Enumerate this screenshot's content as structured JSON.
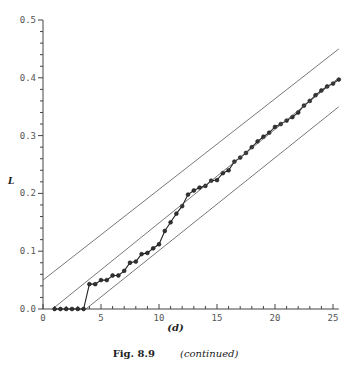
{
  "chart_data": {
    "type": "line",
    "panel_label": "(d)",
    "title": "",
    "xlabel": "",
    "ylabel": "L",
    "xlim": [
      0,
      25.5
    ],
    "ylim": [
      0,
      0.5
    ],
    "x_ticks": [
      0,
      5,
      10,
      15,
      20,
      25
    ],
    "y_ticks": [
      "0.0",
      "0.1",
      "0.2",
      "0.3",
      "0.4",
      "0.5"
    ],
    "grid": false,
    "series": [
      {
        "name": "observed",
        "style": "line with circle markers",
        "x": [
          1,
          1.5,
          2,
          2.5,
          3,
          3.5,
          4,
          4.5,
          5,
          5.5,
          6,
          6.5,
          7,
          7.5,
          8,
          8.5,
          9,
          9.5,
          10,
          10.5,
          11,
          11.5,
          12,
          12.5,
          13,
          13.5,
          14,
          14.5,
          15,
          15.5,
          16,
          16.5,
          17,
          17.5,
          18,
          18.5,
          19,
          19.5,
          20,
          20.5,
          21,
          21.5,
          22,
          22.5,
          23,
          23.5,
          24,
          24.5,
          25,
          25.5
        ],
        "values": [
          0,
          0,
          0,
          0,
          0,
          0,
          0.043,
          0.043,
          0.05,
          0.05,
          0.058,
          0.058,
          0.066,
          0.08,
          0.082,
          0.095,
          0.097,
          0.105,
          0.112,
          0.135,
          0.15,
          0.165,
          0.178,
          0.198,
          0.205,
          0.21,
          0.213,
          0.222,
          0.223,
          0.235,
          0.24,
          0.255,
          0.262,
          0.27,
          0.28,
          0.29,
          0.298,
          0.305,
          0.315,
          0.32,
          0.326,
          0.332,
          0.34,
          0.352,
          0.36,
          0.37,
          0.378,
          0.385,
          0.39,
          0.397
        ]
      },
      {
        "name": "upper band",
        "style": "thin line",
        "x": [
          0,
          25.5
        ],
        "values": [
          0.05,
          0.45
        ]
      },
      {
        "name": "center line",
        "style": "thin line",
        "x": [
          1,
          25.5
        ],
        "values": [
          0.003,
          0.4
        ]
      },
      {
        "name": "lower band",
        "style": "thin line",
        "x": [
          3.7,
          25.5
        ],
        "values": [
          0,
          0.35
        ]
      }
    ]
  },
  "caption": {
    "figure": "Fig. 8.9",
    "note": "(continued)"
  }
}
